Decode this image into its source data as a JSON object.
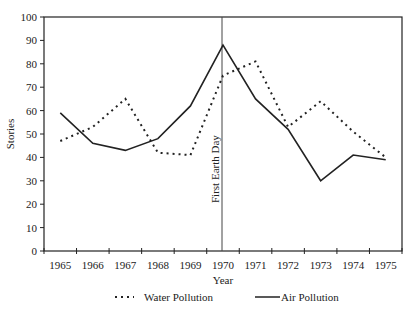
{
  "chart_data": {
    "type": "line",
    "title": "",
    "xlabel": "Year",
    "ylabel": "Stories",
    "categories": [
      "1965",
      "1966",
      "1967",
      "1968",
      "1969",
      "1970",
      "1971",
      "1972",
      "1973",
      "1974",
      "1975"
    ],
    "ylim": [
      0,
      100
    ],
    "yticks": [
      0,
      10,
      20,
      30,
      40,
      50,
      60,
      70,
      80,
      90,
      100
    ],
    "grid": false,
    "legend_position": "bottom",
    "series": [
      {
        "name": "Water Pollution",
        "style": "dotted",
        "color": "#222222",
        "values": [
          47,
          53,
          65,
          42,
          41,
          75,
          81,
          53,
          64,
          51,
          40
        ]
      },
      {
        "name": "Air Pollution",
        "style": "solid",
        "color": "#222222",
        "values": [
          59,
          46,
          43,
          48,
          62,
          88,
          65,
          52,
          30,
          41,
          39
        ]
      }
    ],
    "annotations": [
      {
        "type": "vline",
        "x": "1970",
        "label": "First Earth Day"
      }
    ]
  },
  "legend": {
    "water_label": "Water Pollution",
    "air_label": "Air Pollution"
  },
  "axes": {
    "x_title": "Year",
    "y_title": "Stories",
    "annotation_label": "First Earth Day"
  }
}
